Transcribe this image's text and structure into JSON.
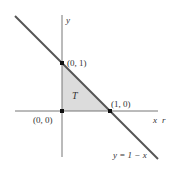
{
  "diagram": {
    "type": "coordinate-plot",
    "region_label": "T",
    "axes": {
      "x_label": "x",
      "x_label_secondary": "r",
      "y_label": "y"
    },
    "points": [
      {
        "label": "(0, 0)",
        "x": 0,
        "y": 0
      },
      {
        "label": "(0, 1)",
        "x": 0,
        "y": 1
      },
      {
        "label": "(1, 0)",
        "x": 1,
        "y": 0
      }
    ],
    "line": {
      "equation_label": "y = 1 − x"
    },
    "colors": {
      "axis": "#777777",
      "line": "#555555",
      "region_fill": "#d9d9d9",
      "point": "#111111",
      "text": "#333333"
    }
  }
}
